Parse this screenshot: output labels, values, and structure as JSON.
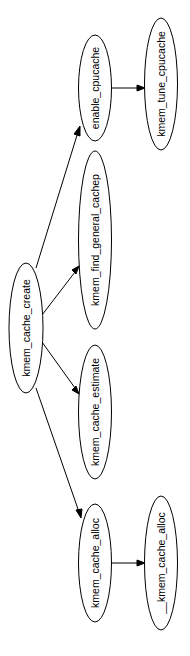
{
  "diagram": {
    "type": "call-graph",
    "orientation": "rotated-90-ccw",
    "nodes": [
      {
        "id": "kmem_cache_create",
        "label": "kmem_cache_create"
      },
      {
        "id": "enable_cpucache",
        "label": "enable_cpucache"
      },
      {
        "id": "kmem_find_general_cachep",
        "label": "kmem_find_general_cachep"
      },
      {
        "id": "kmem_cache_estimate",
        "label": "kmem_cache_estimate"
      },
      {
        "id": "kmem_cache_alloc",
        "label": "kmem_cache_alloc"
      },
      {
        "id": "kmem_tune_cpucache",
        "label": "kmem_tune_cpucache"
      },
      {
        "id": "__kmem_cache_alloc",
        "label": "__kmem_cache_alloc"
      }
    ],
    "edges": [
      {
        "from": "kmem_cache_create",
        "to": "enable_cpucache"
      },
      {
        "from": "kmem_cache_create",
        "to": "kmem_find_general_cachep"
      },
      {
        "from": "kmem_cache_create",
        "to": "kmem_cache_estimate"
      },
      {
        "from": "kmem_cache_create",
        "to": "kmem_cache_alloc"
      },
      {
        "from": "enable_cpucache",
        "to": "kmem_tune_cpucache"
      },
      {
        "from": "kmem_cache_alloc",
        "to": "__kmem_cache_alloc"
      }
    ]
  },
  "labels": {
    "n0": "kmem_cache_create",
    "n1": "enable_cpucache",
    "n2": "kmem_find_general_cachep",
    "n3": "kmem_cache_estimate",
    "n4": "kmem_cache_alloc",
    "n5": "kmem_tune_cpucache",
    "n6": "__kmem_cache_alloc"
  }
}
